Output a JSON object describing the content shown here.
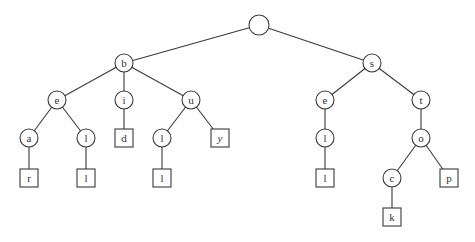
{
  "diagram": {
    "type": "trie",
    "colors": {
      "stroke": "#3a3a3a",
      "text": "#333333",
      "background": "#ffffff"
    },
    "nodes": [
      {
        "id": "root",
        "label": "",
        "shape": "circle",
        "x": 259,
        "y": 25,
        "r": 10
      },
      {
        "id": "b",
        "label": "b",
        "shape": "circle",
        "x": 124,
        "y": 63,
        "r": 9
      },
      {
        "id": "s",
        "label": "s",
        "shape": "circle",
        "x": 372,
        "y": 63,
        "r": 9
      },
      {
        "id": "be",
        "label": "e",
        "shape": "circle",
        "x": 57,
        "y": 100,
        "r": 9
      },
      {
        "id": "bi",
        "label": "i",
        "shape": "circle",
        "x": 124,
        "y": 100,
        "r": 9
      },
      {
        "id": "bu",
        "label": "u",
        "shape": "circle",
        "x": 191,
        "y": 100,
        "r": 9
      },
      {
        "id": "bea",
        "label": "a",
        "shape": "circle",
        "x": 29,
        "y": 138,
        "r": 9
      },
      {
        "id": "bel",
        "label": "l",
        "shape": "circle",
        "x": 86,
        "y": 138,
        "r": 9
      },
      {
        "id": "bid",
        "label": "d",
        "shape": "box",
        "x": 124,
        "y": 138,
        "s": 18
      },
      {
        "id": "bul",
        "label": "l",
        "shape": "circle",
        "x": 162,
        "y": 138,
        "r": 9
      },
      {
        "id": "buy",
        "label": "y",
        "shape": "box",
        "x": 220,
        "y": 138,
        "s": 18,
        "italic": true
      },
      {
        "id": "bear",
        "label": "r",
        "shape": "box",
        "x": 29,
        "y": 178,
        "s": 18
      },
      {
        "id": "bell",
        "label": "l",
        "shape": "box",
        "x": 86,
        "y": 178,
        "s": 18
      },
      {
        "id": "bull",
        "label": "l",
        "shape": "box",
        "x": 162,
        "y": 178,
        "s": 18
      },
      {
        "id": "se",
        "label": "e",
        "shape": "circle",
        "x": 325,
        "y": 100,
        "r": 9
      },
      {
        "id": "st",
        "label": "t",
        "shape": "circle",
        "x": 421,
        "y": 100,
        "r": 9
      },
      {
        "id": "sel",
        "label": "l",
        "shape": "circle",
        "x": 325,
        "y": 138,
        "r": 9
      },
      {
        "id": "sell",
        "label": "l",
        "shape": "box",
        "x": 325,
        "y": 178,
        "s": 18
      },
      {
        "id": "sto",
        "label": "o",
        "shape": "circle",
        "x": 421,
        "y": 138,
        "r": 9
      },
      {
        "id": "stoc",
        "label": "c",
        "shape": "circle",
        "x": 392,
        "y": 178,
        "r": 9
      },
      {
        "id": "stop",
        "label": "p",
        "shape": "box",
        "x": 449,
        "y": 178,
        "s": 18
      },
      {
        "id": "stock",
        "label": "k",
        "shape": "box",
        "x": 392,
        "y": 217,
        "s": 18
      }
    ],
    "edges": [
      [
        "root",
        "b"
      ],
      [
        "root",
        "s"
      ],
      [
        "b",
        "be"
      ],
      [
        "b",
        "bi"
      ],
      [
        "b",
        "bu"
      ],
      [
        "be",
        "bea"
      ],
      [
        "be",
        "bel"
      ],
      [
        "bi",
        "bid"
      ],
      [
        "bu",
        "bul"
      ],
      [
        "bu",
        "buy"
      ],
      [
        "bea",
        "bear"
      ],
      [
        "bel",
        "bell"
      ],
      [
        "bul",
        "bull"
      ],
      [
        "s",
        "se"
      ],
      [
        "s",
        "st"
      ],
      [
        "se",
        "sel"
      ],
      [
        "sel",
        "sell"
      ],
      [
        "st",
        "sto"
      ],
      [
        "sto",
        "stoc"
      ],
      [
        "sto",
        "stop"
      ],
      [
        "stoc",
        "stock"
      ]
    ]
  }
}
